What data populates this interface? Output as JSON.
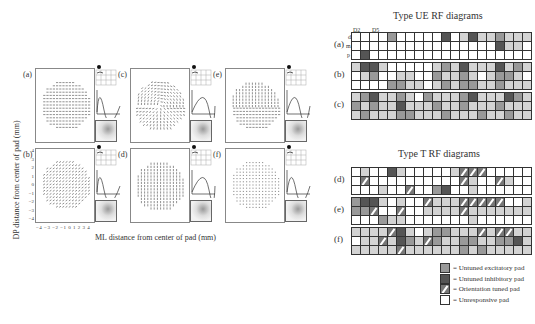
{
  "figure": {
    "left": {
      "y_axis_label": "DP distance from center of pad (mm)",
      "x_axis_label": "ML distance from center of pad (mm)",
      "x_ticks": [
        "−4",
        "−3",
        "−2",
        "−1",
        "0",
        "1",
        "2",
        "3",
        "4"
      ],
      "y_ticks": [
        "4",
        "3",
        "2",
        "1",
        "0",
        "−1",
        "−2",
        "−3",
        "−4"
      ],
      "panels": [
        {
          "label": "(a)",
          "pattern": "horizontal"
        },
        {
          "label": "(b)",
          "pattern": "diagonal"
        },
        {
          "label": "(c)",
          "pattern": "radial"
        },
        {
          "label": "(d)",
          "pattern": "vertical"
        },
        {
          "label": "(e)",
          "pattern": "vertical-mixed"
        },
        {
          "label": "(f)",
          "pattern": "sparse"
        }
      ]
    },
    "right": {
      "ue_title": "Type UE RF diagrams",
      "t_title": "Type T RF diagrams",
      "digit_labels": {
        "d2": "D2",
        "d5": "D5"
      },
      "phalanx_labels": [
        "d",
        "m",
        "p"
      ],
      "ue_rows": [
        {
          "label": "(a)",
          "grids": [
            [
              "u",
              "u",
              "u",
              "u",
              "u",
              "u",
              "u",
              "u",
              "u",
              "i",
              "u",
              "u"
            ],
            [
              "e",
              "u",
              "u",
              "u",
              "u",
              "u",
              "u",
              "u",
              "u",
              "u",
              "u",
              "u"
            ],
            [
              "u",
              "u",
              "i",
              "u",
              "u",
              "u",
              "u",
              "u",
              "u",
              "u",
              "u",
              "u"
            ],
            [
              "l",
              "i",
              "l",
              "l",
              "u",
              "u",
              "u",
              "u",
              "u",
              "u",
              "u",
              "u"
            ],
            [
              "e",
              "l",
              "l",
              "l",
              "i",
              "l",
              "l",
              "u",
              "u",
              "u",
              "u",
              "u"
            ]
          ]
        },
        {
          "label": "(b)",
          "grids": [
            [
              "l",
              "i",
              "i",
              "l",
              "u",
              "l",
              "e",
              "u",
              "u",
              "u",
              "u",
              "u"
            ],
            [
              "u",
              "u",
              "u",
              "u",
              "u",
              "l",
              "l",
              "u",
              "e",
              "e",
              "l",
              "l"
            ],
            [
              "u",
              "l",
              "e",
              "l",
              "u",
              "e",
              "l",
              "l",
              "u",
              "l",
              "e",
              "l"
            ],
            [
              "i",
              "l",
              "l",
              "l",
              "e",
              "l",
              "u",
              "l",
              "e",
              "e",
              "l",
              "l"
            ],
            [
              "i",
              "l",
              "e",
              "l",
              "e",
              "e",
              "l",
              "u",
              "e",
              "l",
              "l",
              "l"
            ]
          ]
        },
        {
          "label": "(c)",
          "grids": [
            [
              "l",
              "e",
              "i",
              "l",
              "e",
              "l",
              "e",
              "l",
              "l",
              "e",
              "l",
              "l"
            ],
            [
              "l",
              "e",
              "l",
              "u",
              "l",
              "i",
              "l",
              "l",
              "l",
              "e",
              "e",
              "l"
            ],
            [
              "e",
              "l",
              "l",
              "l",
              "l",
              "e",
              "l",
              "l",
              "l",
              "l",
              "e",
              "l"
            ],
            [
              "e",
              "i",
              "l",
              "l",
              "e",
              "l",
              "l",
              "l",
              "l",
              "l",
              "e",
              "l"
            ],
            [
              "l",
              "i",
              "e",
              "l",
              "e",
              "l",
              "l",
              "l",
              "l",
              "e",
              "l",
              "l"
            ]
          ]
        }
      ],
      "t_rows": [
        {
          "label": "(d)",
          "grids": [
            [
              "u",
              "l",
              "u",
              "u",
              "u",
              "o",
              "u",
              "u",
              "u",
              "u",
              "u",
              "l"
            ],
            [
              "i",
              "l",
              "u",
              "u",
              "u",
              "u",
              "u",
              "u",
              "u",
              "u",
              "o",
              "u"
            ],
            [
              "u",
              "u",
              "u",
              "l",
              "u",
              "u",
              "u",
              "u",
              "u",
              "e",
              "i",
              "u"
            ],
            [
              "o",
              "o",
              "o",
              "u",
              "o",
              "l",
              "u",
              "u",
              "u",
              "l",
              "u",
              "u"
            ],
            [
              "u",
              "u",
              "u",
              "u",
              "o",
              "l",
              "u",
              "u",
              "u",
              "u",
              "u",
              "u"
            ]
          ]
        },
        {
          "label": "(e)",
          "grids": [
            [
              "e",
              "i",
              "i",
              "l",
              "e",
              "e",
              "o",
              "u",
              "u",
              "u",
              "u",
              "e"
            ],
            [
              "u",
              "l",
              "u",
              "u",
              "u",
              "o",
              "u",
              "u",
              "l",
              "l",
              "u",
              "u"
            ],
            [
              "o",
              "l",
              "l",
              "l",
              "l",
              "l",
              "l",
              "l",
              "u",
              "u",
              "u",
              "u"
            ],
            [
              "o",
              "o",
              "o",
              "o",
              "o",
              "l",
              "l",
              "l",
              "u",
              "l",
              "u",
              "u"
            ],
            [
              "o",
              "u",
              "u",
              "l",
              "l",
              "l",
              "l",
              "l",
              "u",
              "u",
              "u",
              "u"
            ]
          ]
        },
        {
          "label": "(f)",
          "grids": [
            [
              "l",
              "l",
              "l",
              "l",
              "u",
              "l",
              "l",
              "o",
              "l",
              "l",
              "l",
              "l"
            ],
            [
              "o",
              "i",
              "l",
              "u",
              "l",
              "i",
              "e",
              "l",
              "l",
              "o",
              "l",
              "l"
            ],
            [
              "l",
              "e",
              "e",
              "l",
              "o",
              "e",
              "l",
              "l",
              "l",
              "l",
              "l",
              "l"
            ],
            [
              "l",
              "l",
              "o",
              "l",
              "e",
              "e",
              "l",
              "l",
              "e",
              "l",
              "e",
              "l"
            ],
            [
              "o",
              "o",
              "l",
              "l",
              "e",
              "e",
              "i",
              "l",
              "l",
              "l",
              "l",
              "l"
            ]
          ]
        }
      ],
      "legend": [
        {
          "key": "e",
          "label": "= Untuned excitatory pad",
          "color": "#999999"
        },
        {
          "key": "i",
          "label": "= Untuned inhibitory pad",
          "color": "#555555"
        },
        {
          "key": "o",
          "label": "= Orientation tuned pad",
          "color": "#777777"
        },
        {
          "key": "u",
          "label": "= Unresponsive pad",
          "color": "#ffffff"
        }
      ]
    }
  }
}
